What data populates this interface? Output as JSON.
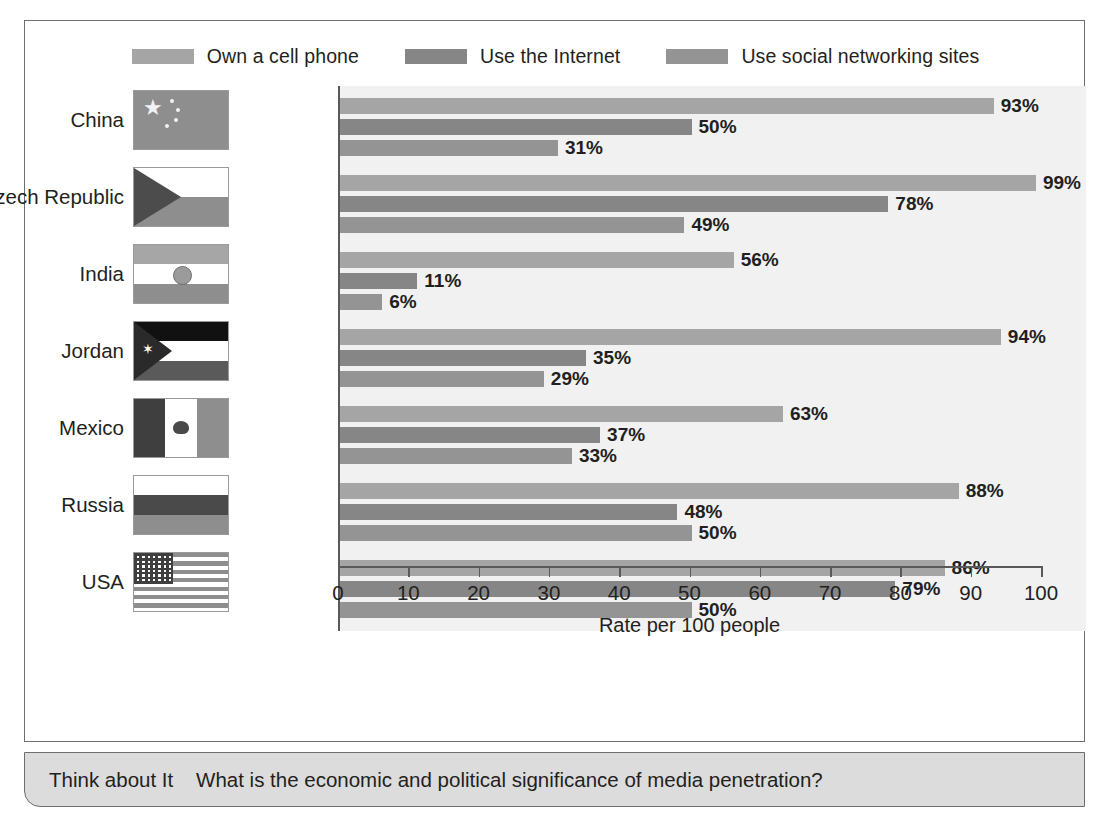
{
  "legend": {
    "items": [
      {
        "label": "Own a cell phone",
        "color": "#a5a5a5",
        "icon": "legend-swatch-icon"
      },
      {
        "label": "Use the Internet",
        "color": "#868686",
        "icon": "legend-swatch-icon"
      },
      {
        "label": "Use social networking sites",
        "color": "#949494",
        "icon": "legend-swatch-icon"
      }
    ]
  },
  "axis": {
    "x_title": "Rate per 100 people",
    "ticks": [
      "0",
      "10",
      "20",
      "30",
      "40",
      "50",
      "60",
      "70",
      "80",
      "90",
      "100"
    ]
  },
  "countries": [
    {
      "name": "China",
      "flag": "flag-china-icon"
    },
    {
      "name": "Czech Republic",
      "flag": "flag-czech-republic-icon"
    },
    {
      "name": "India",
      "flag": "flag-india-icon"
    },
    {
      "name": "Jordan",
      "flag": "flag-jordan-icon"
    },
    {
      "name": "Mexico",
      "flag": "flag-mexico-icon"
    },
    {
      "name": "Russia",
      "flag": "flag-russia-icon"
    },
    {
      "name": "USA",
      "flag": "flag-usa-icon"
    }
  ],
  "footer": {
    "lead": "Think about It",
    "question": "What is the economic and political significance of media penetration?"
  },
  "chart_data": {
    "type": "bar",
    "orientation": "horizontal",
    "title": "",
    "xlabel": "Rate per 100 people",
    "ylabel": "",
    "xlim": [
      0,
      100
    ],
    "xticks": [
      0,
      10,
      20,
      30,
      40,
      50,
      60,
      70,
      80,
      90,
      100
    ],
    "grid": false,
    "legend_position": "top",
    "categories": [
      "China",
      "Czech Republic",
      "India",
      "Jordan",
      "Mexico",
      "Russia",
      "USA"
    ],
    "series": [
      {
        "name": "Own a cell phone",
        "color": "#a5a5a5",
        "values": [
          93,
          99,
          56,
          94,
          63,
          88,
          86
        ],
        "labels": [
          "93%",
          "99%",
          "56%",
          "94%",
          "63%",
          "88%",
          "86%"
        ]
      },
      {
        "name": "Use the Internet",
        "color": "#868686",
        "values": [
          50,
          78,
          11,
          35,
          37,
          48,
          79
        ],
        "labels": [
          "50%",
          "78%",
          "11%",
          "35%",
          "37%",
          "48%",
          "79%"
        ]
      },
      {
        "name": "Use social networking sites",
        "color": "#949494",
        "values": [
          31,
          49,
          6,
          29,
          33,
          50,
          50
        ],
        "labels": [
          "31%",
          "49%",
          "6%",
          "29%",
          "33%",
          "50%",
          "50%"
        ]
      }
    ]
  }
}
